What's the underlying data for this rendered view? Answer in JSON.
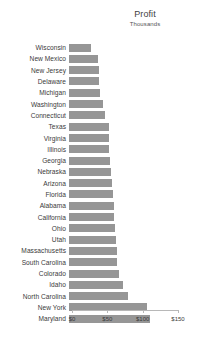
{
  "chart_data": {
    "type": "bar",
    "orientation": "horizontal",
    "title": "Profit",
    "subtitle": "Thousands",
    "xlabel": "",
    "ylabel": "",
    "xlim": [
      0,
      150
    ],
    "grid": false,
    "legend": null,
    "bar_color": "#969696",
    "tick_prefix": "$",
    "xticks": [
      0,
      50,
      100,
      150
    ],
    "xtick_labels": [
      "$0",
      "$50",
      "$100",
      "$150"
    ],
    "categories": [
      "Wisconsin",
      "New Mexico",
      "New Jersey",
      "Delaware",
      "Michigan",
      "Washington",
      "Connecticut",
      "Texas",
      "Virginia",
      "Illinois",
      "Georgia",
      "Nebraska",
      "Arizona",
      "Florida",
      "Alabama",
      "California",
      "Ohio",
      "Utah",
      "Massachusetts",
      "South Carolina",
      "Colorado",
      "Idaho",
      "North Carolina",
      "New York",
      "Maryland"
    ],
    "values": [
      31,
      41,
      42,
      42,
      44,
      48,
      51,
      56,
      57,
      57,
      58,
      60,
      61,
      62,
      64,
      64,
      65,
      66,
      68,
      68,
      71,
      77,
      84,
      111,
      115
    ]
  }
}
